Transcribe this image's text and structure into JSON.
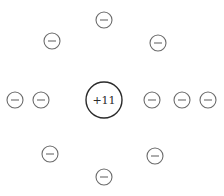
{
  "diagram": {
    "nucleus": {
      "label": "+11",
      "cx": 104,
      "cy": 100,
      "r": 18
    },
    "electron_radius": 8,
    "electrons": [
      {
        "id": "top",
        "cx": 104,
        "cy": 20,
        "symbol": "−"
      },
      {
        "id": "upper-left",
        "cx": 52,
        "cy": 41,
        "symbol": "−"
      },
      {
        "id": "upper-right",
        "cx": 158,
        "cy": 43,
        "symbol": "−"
      },
      {
        "id": "left-outer",
        "cx": 15,
        "cy": 100,
        "symbol": "−"
      },
      {
        "id": "left-inner",
        "cx": 41,
        "cy": 100,
        "symbol": "−"
      },
      {
        "id": "right-inner",
        "cx": 152,
        "cy": 100,
        "symbol": "−"
      },
      {
        "id": "right-middle",
        "cx": 182,
        "cy": 100,
        "symbol": "−"
      },
      {
        "id": "right-outer",
        "cx": 208,
        "cy": 100,
        "symbol": "−"
      },
      {
        "id": "lower-left",
        "cx": 50,
        "cy": 154,
        "symbol": "−"
      },
      {
        "id": "lower-right",
        "cx": 155,
        "cy": 156,
        "symbol": "−"
      },
      {
        "id": "bottom",
        "cx": 104,
        "cy": 177,
        "symbol": "−"
      }
    ],
    "colors": {
      "electron_stroke": "#6b6b6b",
      "nucleus_stroke": "#2b2b2b",
      "background": "#ffffff"
    }
  }
}
